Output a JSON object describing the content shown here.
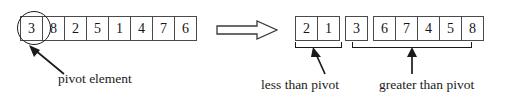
{
  "figure": {
    "ink_color": "#1a1a1a",
    "cell_border_color": "#4a4a4a"
  },
  "initial_array": {
    "name": "initial-array",
    "cells": [
      "3",
      "8",
      "2",
      "5",
      "1",
      "4",
      "7",
      "6"
    ],
    "pivot_index": 0,
    "pivot_value": "3"
  },
  "transform": {
    "arrow_icon": "right-double-arrow-outline"
  },
  "partitioned_array": {
    "name": "partitioned-array",
    "groups": [
      {
        "key": "less",
        "cells": [
          "2",
          "1"
        ]
      },
      {
        "key": "pivot",
        "cells": [
          "3"
        ]
      },
      {
        "key": "greater",
        "cells": [
          "6",
          "7",
          "4",
          "5",
          "8"
        ]
      }
    ]
  },
  "annotations": {
    "pivot_element_label": "pivot element",
    "less_than_pivot_label": "less than pivot",
    "greater_than_pivot_label": "greater than pivot",
    "pivot_circle_icon": "circle-highlight-icon",
    "pivot_callout_icon": "callout-arrow-icon",
    "less_pointer_icon": "up-arrow-icon",
    "greater_pointer_icon": "up-arrow-icon"
  }
}
